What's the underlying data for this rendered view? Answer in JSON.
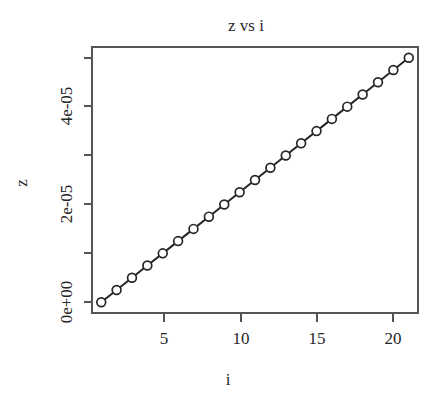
{
  "chart_data": {
    "type": "line",
    "title": "z vs i",
    "xlabel": "i",
    "ylabel": "z",
    "x": [
      1,
      2,
      3,
      4,
      5,
      6,
      7,
      8,
      9,
      10,
      11,
      12,
      13,
      14,
      15,
      16,
      17,
      18,
      19,
      20,
      21
    ],
    "values": [
      0.0,
      2.5e-06,
      5e-06,
      7.5e-06,
      1e-05,
      1.25e-05,
      1.5e-05,
      1.75e-05,
      2e-05,
      2.25e-05,
      2.5e-05,
      2.75e-05,
      3e-05,
      3.25e-05,
      3.5e-05,
      3.75e-05,
      4e-05,
      4.25e-05,
      4.5e-05,
      4.75e-05,
      5e-05
    ],
    "series": [
      {
        "name": "z",
        "values": [
          0.0,
          2.5e-06,
          5e-06,
          7.5e-06,
          1e-05,
          1.25e-05,
          1.5e-05,
          1.75e-05,
          2e-05,
          2.25e-05,
          2.5e-05,
          2.75e-05,
          3e-05,
          3.25e-05,
          3.5e-05,
          3.75e-05,
          4e-05,
          4.25e-05,
          4.5e-05,
          4.75e-05,
          5e-05
        ]
      }
    ],
    "xlim": [
      0.4,
      21.6
    ],
    "ylim": [
      -2.2e-06,
      5.22e-05
    ],
    "xticks": [
      5,
      10,
      15,
      20
    ],
    "xticklabels": [
      "5",
      "10",
      "15",
      "20"
    ],
    "yticks": [
      0.0,
      1e-05,
      2e-05,
      3e-05,
      4e-05,
      5e-05
    ],
    "yticklabels": [
      "0e+00",
      "",
      "2e-05",
      "",
      "4e-05",
      ""
    ],
    "grid": false,
    "legend": false,
    "marker": "open-circle",
    "line_color": "#262626",
    "marker_color": "#262626",
    "axis_color": "#4a4a4a",
    "background": "#ffffff"
  },
  "labels": {
    "title": "z vs i",
    "x_axis_title": "i",
    "y_axis_title": "z",
    "xtick_5": "5",
    "xtick_10": "10",
    "xtick_15": "15",
    "xtick_20": "20",
    "ytick_0": "0e+00",
    "ytick_2": "2e-05",
    "ytick_4": "4e-05"
  }
}
